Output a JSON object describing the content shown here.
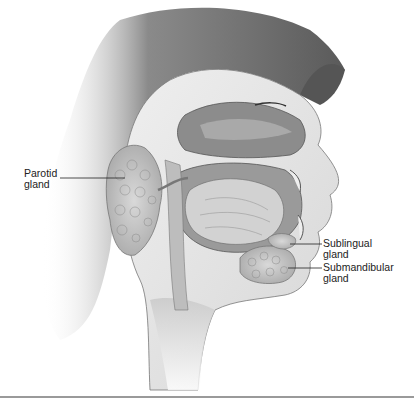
{
  "figure": {
    "labels": [
      {
        "id": "parotid",
        "line1": "Parotid",
        "line2": "gland"
      },
      {
        "id": "sublingual",
        "line1": "Sublingual",
        "line2": "gland"
      },
      {
        "id": "submandibular",
        "line1": "Submandibular",
        "line2": "gland"
      }
    ]
  }
}
